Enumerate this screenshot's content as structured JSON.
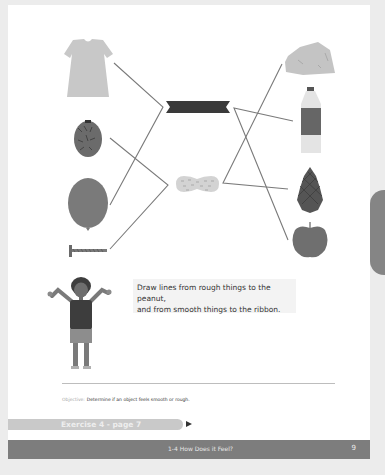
{
  "instruction": {
    "line1": "Draw lines from rough things to the peanut,",
    "line2": "and from smooth things to the ribbon."
  },
  "objective": {
    "label": "Objective:",
    "text": "Determine if an object feels smooth or rough."
  },
  "exercise_banner": {
    "label": "Exercise 4 - page 7"
  },
  "footer": {
    "section_title": "1-4  How Does it Feel?",
    "page_number": "9"
  },
  "illustration": {
    "left_items": [
      "dress",
      "pineapple",
      "balloon",
      "nail"
    ],
    "center_targets": [
      "ribbon",
      "peanut"
    ],
    "right_items": [
      "rock",
      "water-bottle",
      "pinecone",
      "apple"
    ],
    "connections": [
      {
        "from": "dress",
        "to": "ribbon"
      },
      {
        "from": "balloon",
        "to": "ribbon"
      },
      {
        "from": "pineapple",
        "to": "peanut"
      },
      {
        "from": "nail",
        "to": "peanut"
      },
      {
        "from": "water-bottle",
        "to": "ribbon"
      },
      {
        "from": "apple",
        "to": "ribbon"
      },
      {
        "from": "rock",
        "to": "peanut"
      },
      {
        "from": "pinecone",
        "to": "peanut"
      }
    ]
  },
  "colors": {
    "page_bg": "#ffffff",
    "outer_bg": "#ececec",
    "line": "#7a7a7a",
    "footer_bg": "#7d7d7d",
    "banner_bg": "#c9c9c9"
  }
}
